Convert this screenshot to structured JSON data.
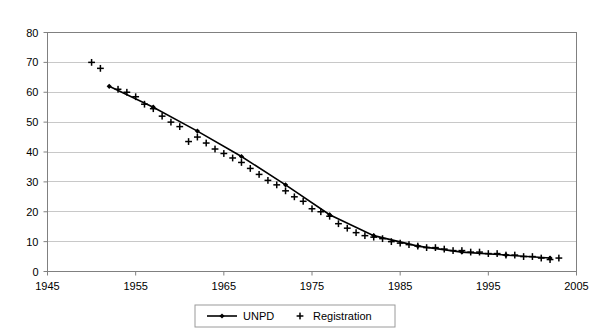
{
  "chart_data": {
    "type": "line",
    "title": "",
    "subtitle": "",
    "xlabel": "",
    "ylabel": "",
    "xlim": [
      1945,
      2005
    ],
    "ylim": [
      0,
      80
    ],
    "xticks": [
      1945,
      1955,
      1965,
      1975,
      1985,
      1995,
      2005
    ],
    "yticks": [
      0,
      10,
      20,
      30,
      40,
      50,
      60,
      70,
      80
    ],
    "xtick_labels": [
      "1945",
      "1955",
      "1965",
      "1975",
      "1985",
      "1995",
      "2005"
    ],
    "ytick_labels": [
      "0",
      "10",
      "20",
      "30",
      "40",
      "50",
      "60",
      "70",
      "80"
    ],
    "grid": "horizontal",
    "legend_position": "bottom-center",
    "series": [
      {
        "name": "UNPD",
        "marker": "diamond",
        "style": "line-with-markers",
        "color": "#000000",
        "x": [
          1952,
          1957,
          1962,
          1967,
          1972,
          1977,
          1982,
          1987,
          1992,
          1997,
          2002
        ],
        "values": [
          62.0,
          55.0,
          47.0,
          38.5,
          29.0,
          19.0,
          12.0,
          8.5,
          6.5,
          5.5,
          4.5
        ]
      },
      {
        "name": "Registration",
        "marker": "plus",
        "style": "markers-only",
        "color": "#000000",
        "x": [
          1950,
          1951,
          1953,
          1954,
          1955,
          1956,
          1957,
          1958,
          1959,
          1960,
          1961,
          1962,
          1963,
          1964,
          1965,
          1966,
          1967,
          1968,
          1969,
          1970,
          1971,
          1972,
          1973,
          1974,
          1975,
          1976,
          1977,
          1978,
          1979,
          1980,
          1981,
          1982,
          1983,
          1984,
          1985,
          1986,
          1987,
          1988,
          1989,
          1990,
          1991,
          1992,
          1993,
          1994,
          1995,
          1996,
          1997,
          1998,
          1999,
          2000,
          2001,
          2002,
          2003
        ],
        "values": [
          70.0,
          68.0,
          61.0,
          60.0,
          58.5,
          56.0,
          54.5,
          52.0,
          50.0,
          48.5,
          43.5,
          45.0,
          43.0,
          41.0,
          39.5,
          38.0,
          36.5,
          34.5,
          32.5,
          30.5,
          29.0,
          27.0,
          25.0,
          23.5,
          21.0,
          20.0,
          18.5,
          16.0,
          14.5,
          13.0,
          12.0,
          11.5,
          11.0,
          10.0,
          9.5,
          9.0,
          8.5,
          8.0,
          8.0,
          7.5,
          7.0,
          7.0,
          6.5,
          6.5,
          6.0,
          6.0,
          5.5,
          5.5,
          5.0,
          5.0,
          4.5,
          4.0,
          4.5
        ]
      }
    ],
    "legend": [
      {
        "label": "UNPD",
        "marker": "line-diamond"
      },
      {
        "label": "Registration",
        "marker": "plus"
      }
    ]
  },
  "legend": {
    "unpd_label": "UNPD",
    "registration_label": "Registration"
  },
  "colors": {
    "series": "#000000",
    "grid": "#c8c8c8",
    "axis": "#808080",
    "background": "#ffffff"
  }
}
